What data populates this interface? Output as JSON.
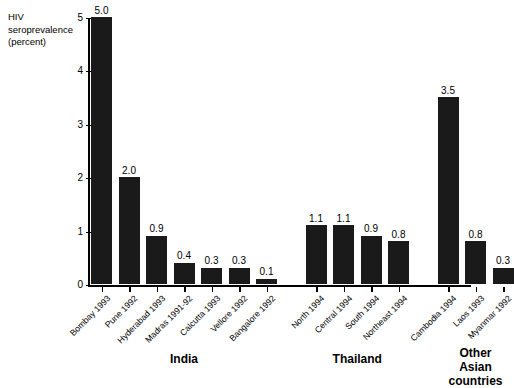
{
  "chart_data": {
    "type": "bar",
    "title": "",
    "ylabel": "HIV seroprevalence (percent)",
    "xlabel": "",
    "ylim": [
      0,
      5
    ],
    "yticks": [
      0,
      1,
      2,
      3,
      4,
      5
    ],
    "ytick_labels": [
      "0",
      "1",
      "2",
      "3",
      "4",
      "5"
    ],
    "grid": false,
    "legend": "none",
    "bar_color": "#1a1a1a",
    "categories": [
      "Bombay 1993",
      "Pune 1992",
      "Hyderabad 1993",
      "Madras 1991-92",
      "Calcutta 1993",
      "Vellore 1992",
      "Bangalore 1992",
      "North 1994",
      "Central 1994",
      "South 1994",
      "Northeast 1994",
      "Cambodia 1994",
      "Laos 1993",
      "Myanmar 1992"
    ],
    "values": [
      5.0,
      2.0,
      0.9,
      0.4,
      0.3,
      0.3,
      0.1,
      1.1,
      1.1,
      0.9,
      0.8,
      3.5,
      0.8,
      0.3
    ],
    "value_labels": [
      "5.0",
      "2.0",
      "0.9",
      "0.4",
      "0.3",
      "0.3",
      "0.1",
      "1.1",
      "1.1",
      "0.9",
      "0.8",
      "3.5",
      "0.8",
      "0.3"
    ],
    "groups": [
      {
        "label": "India",
        "start": 0,
        "end": 6
      },
      {
        "label": "Thailand",
        "start": 7,
        "end": 10
      },
      {
        "label": "Other Asian\ncountries",
        "start": 11,
        "end": 13
      }
    ]
  },
  "axis": {
    "y_title": "HIV\nseroprevalence\n(percent)"
  }
}
